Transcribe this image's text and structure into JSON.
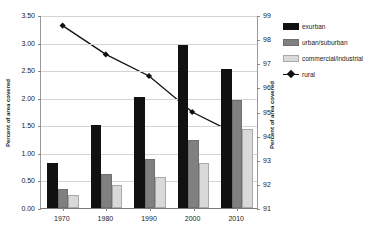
{
  "chart_data": {
    "type": "bar",
    "title": "",
    "xlabel": "",
    "ylabel": "Percent of area covered",
    "y2label": "Percent of area covered",
    "categories": [
      "1970",
      "1980",
      "1990",
      "2000",
      "2010"
    ],
    "ylim": [
      0.0,
      3.5
    ],
    "y2lim": [
      91,
      99
    ],
    "ytick_labels": [
      "0.00",
      "0.50",
      "1.00",
      "1.50",
      "2.00",
      "2.50",
      "3.00",
      "3.50"
    ],
    "ytick_values": [
      0.0,
      0.5,
      1.0,
      1.5,
      2.0,
      2.5,
      3.0,
      3.5
    ],
    "y2tick_labels": [
      "91",
      "92",
      "93",
      "94",
      "95",
      "96",
      "97",
      "98",
      "99"
    ],
    "y2tick_values": [
      91,
      92,
      93,
      94,
      95,
      96,
      97,
      98,
      99
    ],
    "grid": true,
    "legend_position": "right",
    "series": [
      {
        "name": "exurban",
        "kind": "bar",
        "axis": "left",
        "color": "#111111",
        "values": [
          0.82,
          1.51,
          2.02,
          2.95,
          2.52
        ]
      },
      {
        "name": "urban/suburban",
        "kind": "bar",
        "axis": "left",
        "color": "#808080",
        "values": [
          0.35,
          0.62,
          0.88,
          1.23,
          1.96
        ]
      },
      {
        "name": "commercial/industrial",
        "kind": "bar",
        "axis": "left",
        "color": "#d9d9d9",
        "values": [
          0.24,
          0.41,
          0.56,
          0.82,
          1.43
        ]
      },
      {
        "name": "rural",
        "kind": "line",
        "axis": "right",
        "color": "#111111",
        "marker": "diamond",
        "values": [
          98.6,
          97.4,
          96.5,
          95.0,
          94.1
        ]
      }
    ]
  },
  "legend": {
    "items": [
      {
        "label": "exurban",
        "swatch": "exurban-swatch"
      },
      {
        "label": "urban/suburban",
        "swatch": "urban-suburban-swatch"
      },
      {
        "label": "commercial/industrial",
        "swatch": "commercial-industrial-swatch"
      },
      {
        "label": "rural",
        "swatch": "rural-line-marker"
      }
    ]
  }
}
